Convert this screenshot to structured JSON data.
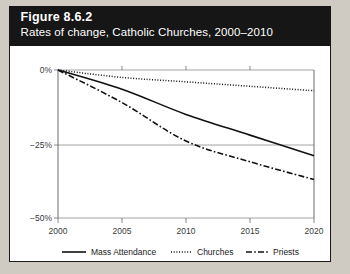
{
  "figure": {
    "number_label": "Figure 8.6.2",
    "subtitle": "Rates of change, Catholic Churches, 2000–2010"
  },
  "colors": {
    "header_background": "#161616",
    "header_text": "#ffffff",
    "card_background": "#ffffff",
    "page_background": "#cfcac2",
    "line_color": "#111111",
    "gridline": "#8e8e8e",
    "axis_text": "#3a3a3a"
  },
  "chart_data": {
    "type": "line",
    "title": "Rates of change, Catholic Churches, 2000–2010",
    "xlabel": "",
    "ylabel": "",
    "x": [
      2000,
      2005,
      2010,
      2015,
      2020
    ],
    "xticklabels": [
      "2000",
      "2005",
      "2010",
      "2015",
      "2020"
    ],
    "yticks": [
      0,
      -25,
      -50
    ],
    "yticklabels": [
      "0%",
      "−25%",
      "−50%"
    ],
    "xlim": [
      2000,
      2020
    ],
    "ylim": [
      -50,
      0
    ],
    "grid": "horizontal",
    "legend_position": "bottom",
    "series": [
      {
        "name": "Mass Attendance",
        "style": "solid",
        "values": [
          0,
          -6.5,
          -15,
          -22,
          -29
        ]
      },
      {
        "name": "Churches",
        "style": "dotted",
        "values": [
          0,
          -2.5,
          -4,
          -5.5,
          -7
        ]
      },
      {
        "name": "Priests",
        "style": "dash-dot",
        "values": [
          0,
          -11,
          -24,
          -31,
          -37
        ]
      }
    ]
  },
  "legend": {
    "items": [
      {
        "label": "Mass Attendance",
        "style": "solid"
      },
      {
        "label": "Churches",
        "style": "dotted"
      },
      {
        "label": "Priests",
        "style": "dash-dot"
      }
    ]
  }
}
